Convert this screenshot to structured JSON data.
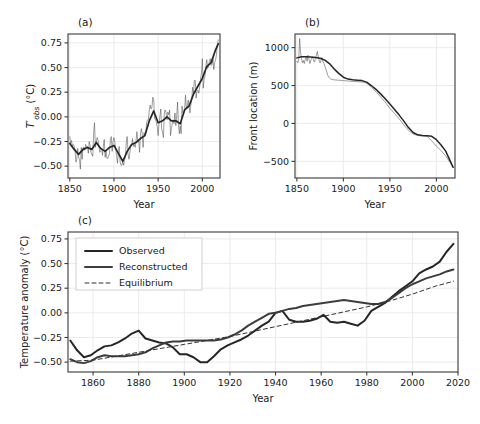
{
  "figure": {
    "background": "#ffffff",
    "ink": "#1a1a1a",
    "grid_color": "#e9e9e9",
    "spine_color": "#3a3a3a"
  },
  "chart_data": [
    {
      "id": "panel-a",
      "type": "line",
      "panel_label": "(a)",
      "title": "",
      "xlabel": "Year",
      "ylabel": "T'obs (°C)",
      "ylabel_parts": {
        "symbol": "T",
        "prime": "′",
        "subscript": "obs",
        "units": "(°C)"
      },
      "xlim": [
        1848,
        2020
      ],
      "ylim": [
        -0.62,
        0.84
      ],
      "xticks": [
        1850,
        1900,
        1950,
        2000
      ],
      "yticks": [
        -0.5,
        -0.25,
        0.0,
        0.25,
        0.5,
        0.75
      ],
      "ytick_labels": [
        "−0.50",
        "−0.25",
        "0.00",
        "0.25",
        "0.50",
        "0.75"
      ],
      "grid": true,
      "legend": "none",
      "series": [
        {
          "name": "annual",
          "style": "thin-solid",
          "color": "#4d4d4d",
          "width": 0.55,
          "x": [
            1850,
            1851,
            1852,
            1853,
            1854,
            1855,
            1856,
            1857,
            1858,
            1859,
            1860,
            1861,
            1862,
            1863,
            1864,
            1865,
            1866,
            1867,
            1868,
            1869,
            1870,
            1871,
            1872,
            1873,
            1874,
            1875,
            1876,
            1877,
            1878,
            1879,
            1880,
            1881,
            1882,
            1883,
            1884,
            1885,
            1886,
            1887,
            1888,
            1889,
            1890,
            1891,
            1892,
            1893,
            1894,
            1895,
            1896,
            1897,
            1898,
            1899,
            1900,
            1901,
            1902,
            1903,
            1904,
            1905,
            1906,
            1907,
            1908,
            1909,
            1910,
            1911,
            1912,
            1913,
            1914,
            1915,
            1916,
            1917,
            1918,
            1919,
            1920,
            1921,
            1922,
            1923,
            1924,
            1925,
            1926,
            1927,
            1928,
            1929,
            1930,
            1931,
            1932,
            1933,
            1934,
            1935,
            1936,
            1937,
            1938,
            1939,
            1940,
            1941,
            1942,
            1943,
            1944,
            1945,
            1946,
            1947,
            1948,
            1949,
            1950,
            1951,
            1952,
            1953,
            1954,
            1955,
            1956,
            1957,
            1958,
            1959,
            1960,
            1961,
            1962,
            1963,
            1964,
            1965,
            1966,
            1967,
            1968,
            1969,
            1970,
            1971,
            1972,
            1973,
            1974,
            1975,
            1976,
            1977,
            1978,
            1979,
            1980,
            1981,
            1982,
            1983,
            1984,
            1985,
            1986,
            1987,
            1988,
            1989,
            1990,
            1991,
            1992,
            1993,
            1994,
            1995,
            1996,
            1997,
            1998,
            1999,
            2000,
            2001,
            2002,
            2003,
            2004,
            2005,
            2006,
            2007,
            2008,
            2009,
            2010,
            2011,
            2012,
            2013,
            2014,
            2015,
            2016,
            2017,
            2018
          ],
          "y": [
            -0.2,
            -0.27,
            -0.24,
            -0.3,
            -0.28,
            -0.3,
            -0.34,
            -0.46,
            -0.43,
            -0.32,
            -0.41,
            -0.43,
            -0.53,
            -0.31,
            -0.43,
            -0.31,
            -0.31,
            -0.34,
            -0.28,
            -0.3,
            -0.3,
            -0.37,
            -0.25,
            -0.29,
            -0.36,
            -0.38,
            -0.4,
            -0.16,
            -0.06,
            -0.31,
            -0.25,
            -0.21,
            -0.24,
            -0.29,
            -0.36,
            -0.34,
            -0.32,
            -0.39,
            -0.3,
            -0.23,
            -0.41,
            -0.35,
            -0.42,
            -0.42,
            -0.4,
            -0.37,
            -0.22,
            -0.2,
            -0.35,
            -0.25,
            -0.21,
            -0.26,
            -0.32,
            -0.4,
            -0.47,
            -0.35,
            -0.3,
            -0.46,
            -0.49,
            -0.49,
            -0.45,
            -0.49,
            -0.44,
            -0.41,
            -0.25,
            -0.2,
            -0.38,
            -0.43,
            -0.36,
            -0.3,
            -0.29,
            -0.22,
            -0.3,
            -0.28,
            -0.31,
            -0.24,
            -0.15,
            -0.26,
            -0.23,
            -0.36,
            -0.17,
            -0.12,
            -0.17,
            -0.31,
            -0.16,
            -0.19,
            -0.17,
            -0.06,
            -0.03,
            -0.03,
            0.07,
            0.12,
            0.08,
            0.1,
            0.2,
            0.17,
            -0.02,
            -0.02,
            -0.06,
            -0.1,
            -0.19,
            -0.07,
            0.01,
            0.08,
            -0.12,
            -0.16,
            -0.21,
            0.04,
            0.07,
            0.04,
            -0.03,
            0.05,
            0.02,
            0.07,
            -0.19,
            -0.12,
            -0.07,
            -0.03,
            -0.07,
            0.04,
            -0.09,
            0.01,
            0.15,
            -0.08,
            -0.17,
            -0.09,
            -0.17,
            0.11,
            0.04,
            0.05,
            0.08,
            0.22,
            0.08,
            0.11,
            0.17,
            0.1,
            0.04,
            0.12,
            0.17,
            0.3,
            0.24,
            0.37,
            0.37,
            0.19,
            0.26,
            0.27,
            0.24,
            0.3,
            0.38,
            0.45,
            0.59,
            0.29,
            0.38,
            0.41,
            0.51,
            0.58,
            0.49,
            0.51,
            0.57,
            0.59,
            0.52,
            0.53,
            0.59,
            0.48,
            0.55,
            0.58,
            0.63,
            0.73,
            0.78,
            0.69,
            0.7
          ]
        },
        {
          "name": "smoothed",
          "style": "thick-solid",
          "color": "#262626",
          "width": 1.7,
          "x": [
            1850,
            1855,
            1860,
            1865,
            1870,
            1875,
            1880,
            1885,
            1890,
            1895,
            1900,
            1905,
            1910,
            1915,
            1920,
            1925,
            1930,
            1935,
            1940,
            1945,
            1950,
            1955,
            1960,
            1965,
            1970,
            1975,
            1980,
            1985,
            1990,
            1995,
            2000,
            2005,
            2010,
            2015,
            2018
          ],
          "y": [
            -0.27,
            -0.33,
            -0.38,
            -0.33,
            -0.31,
            -0.33,
            -0.26,
            -0.32,
            -0.35,
            -0.31,
            -0.29,
            -0.37,
            -0.45,
            -0.35,
            -0.28,
            -0.26,
            -0.22,
            -0.19,
            -0.04,
            0.06,
            -0.06,
            -0.04,
            0.0,
            -0.04,
            -0.04,
            -0.07,
            0.07,
            0.11,
            0.23,
            0.31,
            0.39,
            0.51,
            0.55,
            0.68,
            0.74
          ]
        }
      ]
    },
    {
      "id": "panel-b",
      "type": "line",
      "panel_label": "(b)",
      "title": "",
      "xlabel": "Year",
      "ylabel": "Front location (m)",
      "xlim": [
        1848,
        2020
      ],
      "ylim": [
        -720,
        1180
      ],
      "xticks": [
        1850,
        1900,
        1950,
        2000
      ],
      "yticks": [
        -500,
        0,
        500,
        1000
      ],
      "ytick_labels": [
        "−500",
        "0",
        "500",
        "1000"
      ],
      "grid": true,
      "legend": "none",
      "series": [
        {
          "name": "annual",
          "style": "thin-solid",
          "color": "#4d4d4d",
          "width": 0.55,
          "x": [
            1850,
            1851,
            1852,
            1853,
            1854,
            1855,
            1856,
            1857,
            1858,
            1859,
            1860,
            1861,
            1862,
            1863,
            1864,
            1865,
            1866,
            1867,
            1868,
            1869,
            1870,
            1871,
            1872,
            1873,
            1874,
            1875,
            1876,
            1877,
            1878,
            1879,
            1880,
            1881,
            1882,
            1883,
            1884,
            1885,
            1886,
            1887,
            1888,
            1890,
            1895,
            1900,
            1905,
            1910,
            1915,
            1920,
            1925,
            1930,
            1935,
            1940,
            1945,
            1950,
            1955,
            1960,
            1965,
            1970,
            1975,
            1980,
            1985,
            1990,
            1995,
            2000,
            2005,
            2010,
            2015,
            2018
          ],
          "y": [
            820,
            800,
            845,
            1120,
            930,
            860,
            800,
            830,
            790,
            845,
            880,
            820,
            900,
            850,
            790,
            830,
            860,
            880,
            830,
            810,
            860,
            900,
            950,
            870,
            830,
            800,
            830,
            870,
            810,
            800,
            760,
            720,
            690,
            640,
            620,
            600,
            590,
            585,
            580,
            575,
            570,
            565,
            560,
            555,
            550,
            548,
            530,
            480,
            420,
            350,
            280,
            200,
            130,
            60,
            -20,
            -90,
            -140,
            -160,
            -165,
            -170,
            -230,
            -300,
            -360,
            -430,
            -520,
            -580
          ]
        },
        {
          "name": "smoothed",
          "style": "thick-solid",
          "color": "#262626",
          "width": 1.5,
          "x": [
            1850,
            1855,
            1860,
            1865,
            1870,
            1875,
            1880,
            1885,
            1890,
            1895,
            1900,
            1905,
            1910,
            1915,
            1920,
            1925,
            1930,
            1935,
            1940,
            1945,
            1950,
            1955,
            1960,
            1965,
            1970,
            1975,
            1980,
            1985,
            1990,
            1995,
            2000,
            2005,
            2010,
            2015,
            2018
          ],
          "y": [
            865,
            880,
            880,
            875,
            870,
            860,
            835,
            790,
            720,
            660,
            610,
            585,
            575,
            570,
            565,
            545,
            500,
            450,
            390,
            325,
            255,
            185,
            110,
            30,
            -55,
            -120,
            -150,
            -160,
            -163,
            -170,
            -215,
            -285,
            -365,
            -500,
            -580
          ]
        }
      ]
    },
    {
      "id": "panel-c",
      "type": "line",
      "panel_label": "(c)",
      "title": "",
      "xlabel": "Year",
      "ylabel": "Temperature anomaly (°C)",
      "xlim": [
        1849,
        2020
      ],
      "ylim": [
        -0.6,
        0.82
      ],
      "xticks": [
        1860,
        1880,
        1900,
        1920,
        1940,
        1960,
        1980,
        2000,
        2020
      ],
      "yticks": [
        -0.5,
        -0.25,
        0.0,
        0.25,
        0.5,
        0.75
      ],
      "ytick_labels": [
        "−0.50",
        "−0.25",
        "0.00",
        "0.25",
        "0.50",
        "0.75"
      ],
      "grid": true,
      "legend": "upper-left",
      "legend_entries": [
        "Observed",
        "Reconstructed",
        "Equilibrium"
      ],
      "series": [
        {
          "name": "Observed",
          "style": "thick-solid",
          "color": "#262626",
          "width": 2.0,
          "dash": "none",
          "x": [
            1850,
            1853,
            1856,
            1859,
            1862,
            1865,
            1868,
            1871,
            1874,
            1877,
            1880,
            1883,
            1886,
            1889,
            1892,
            1895,
            1898,
            1901,
            1904,
            1907,
            1910,
            1913,
            1916,
            1919,
            1922,
            1925,
            1928,
            1931,
            1934,
            1937,
            1940,
            1943,
            1946,
            1949,
            1952,
            1955,
            1958,
            1961,
            1964,
            1967,
            1970,
            1973,
            1976,
            1979,
            1982,
            1985,
            1988,
            1991,
            1994,
            1997,
            2000,
            2003,
            2006,
            2009,
            2012,
            2015,
            2018
          ],
          "y": [
            -0.28,
            -0.38,
            -0.45,
            -0.43,
            -0.38,
            -0.34,
            -0.33,
            -0.3,
            -0.26,
            -0.21,
            -0.18,
            -0.26,
            -0.28,
            -0.3,
            -0.31,
            -0.35,
            -0.42,
            -0.42,
            -0.45,
            -0.5,
            -0.5,
            -0.44,
            -0.37,
            -0.33,
            -0.3,
            -0.27,
            -0.23,
            -0.18,
            -0.13,
            -0.09,
            0.0,
            0.02,
            -0.07,
            -0.09,
            -0.09,
            -0.08,
            -0.06,
            -0.02,
            -0.09,
            -0.1,
            -0.09,
            -0.11,
            -0.13,
            -0.08,
            0.02,
            0.06,
            0.1,
            0.16,
            0.22,
            0.27,
            0.32,
            0.4,
            0.44,
            0.47,
            0.52,
            0.62,
            0.7
          ]
        },
        {
          "name": "Reconstructed",
          "style": "thick-solid",
          "color": "#3d3d3d",
          "width": 2.0,
          "dash": "none",
          "x": [
            1850,
            1853,
            1856,
            1859,
            1862,
            1865,
            1868,
            1871,
            1874,
            1877,
            1880,
            1883,
            1886,
            1889,
            1892,
            1895,
            1898,
            1901,
            1904,
            1907,
            1910,
            1913,
            1916,
            1919,
            1922,
            1925,
            1928,
            1931,
            1934,
            1937,
            1940,
            1943,
            1946,
            1949,
            1952,
            1955,
            1958,
            1961,
            1964,
            1967,
            1970,
            1973,
            1976,
            1979,
            1982,
            1985,
            1988,
            1991,
            1994,
            1997,
            2000,
            2003,
            2006,
            2009,
            2012,
            2015,
            2018
          ],
          "y": [
            -0.47,
            -0.5,
            -0.51,
            -0.49,
            -0.45,
            -0.43,
            -0.44,
            -0.44,
            -0.44,
            -0.43,
            -0.42,
            -0.4,
            -0.36,
            -0.33,
            -0.3,
            -0.29,
            -0.29,
            -0.28,
            -0.28,
            -0.28,
            -0.28,
            -0.28,
            -0.27,
            -0.25,
            -0.22,
            -0.18,
            -0.13,
            -0.09,
            -0.05,
            -0.01,
            0.0,
            0.02,
            0.04,
            0.05,
            0.07,
            0.08,
            0.09,
            0.1,
            0.11,
            0.12,
            0.13,
            0.12,
            0.11,
            0.1,
            0.09,
            0.09,
            0.11,
            0.15,
            0.2,
            0.25,
            0.29,
            0.32,
            0.35,
            0.37,
            0.39,
            0.42,
            0.44
          ]
        },
        {
          "name": "Equilibrium",
          "style": "dashed",
          "color": "#333333",
          "width": 1.0,
          "dash": "4,3",
          "x": [
            1850,
            1860,
            1870,
            1880,
            1890,
            1900,
            1910,
            1920,
            1930,
            1940,
            1950,
            1960,
            1970,
            1980,
            1990,
            2000,
            2010,
            2018
          ],
          "y": [
            -0.49,
            -0.48,
            -0.44,
            -0.4,
            -0.36,
            -0.32,
            -0.28,
            -0.24,
            -0.19,
            -0.14,
            -0.09,
            -0.04,
            0.01,
            0.06,
            0.12,
            0.19,
            0.27,
            0.32
          ]
        }
      ]
    }
  ]
}
